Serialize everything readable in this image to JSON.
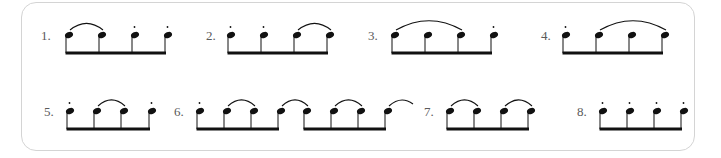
{
  "colors": {
    "ink": "#111111",
    "frame": "#d4d4d4",
    "label": "#5a5a5a"
  },
  "exercises": [
    {
      "label": "1.",
      "label_x": 41,
      "row": 0,
      "groups": [
        {
          "notes": [
            69,
            102,
            135,
            168
          ]
        }
      ],
      "staccato": [
        2,
        3
      ],
      "slurs": [
        [
          0,
          1
        ]
      ],
      "open_slur": false
    },
    {
      "label": "2.",
      "label_x": 206,
      "row": 0,
      "groups": [
        {
          "notes": [
            231,
            264,
            297,
            330
          ]
        }
      ],
      "staccato": [
        0,
        1
      ],
      "slurs": [
        [
          2,
          3
        ]
      ],
      "open_slur": false
    },
    {
      "label": "3.",
      "label_x": 368,
      "row": 0,
      "groups": [
        {
          "notes": [
            395,
            428,
            461,
            494
          ]
        }
      ],
      "staccato": [
        3
      ],
      "slurs": [
        [
          0,
          2
        ]
      ],
      "open_slur": false
    },
    {
      "label": "4.",
      "label_x": 541,
      "row": 0,
      "groups": [
        {
          "notes": [
            566,
            599,
            632,
            665
          ]
        }
      ],
      "staccato": [
        0
      ],
      "slurs": [
        [
          1,
          3
        ]
      ],
      "open_slur": false
    },
    {
      "label": "5.",
      "label_x": 44,
      "row": 1,
      "groups": [
        {
          "notes": [
            70,
            97,
            124,
            152
          ]
        }
      ],
      "staccato": [
        0,
        3
      ],
      "slurs": [
        [
          1,
          2
        ]
      ],
      "open_slur": false
    },
    {
      "label": "6.",
      "label_x": 174,
      "row": 1,
      "groups": [
        {
          "notes": [
            200,
            227,
            254,
            281
          ]
        },
        {
          "notes": [
            307,
            334,
            361,
            388
          ]
        }
      ],
      "staccato": [
        0
      ],
      "slurs": [
        [
          1,
          2
        ],
        [
          3,
          4
        ],
        [
          5,
          6
        ]
      ],
      "open_slur": true
    },
    {
      "label": "7.",
      "label_x": 424,
      "row": 1,
      "groups": [
        {
          "notes": [
            450,
            477,
            504,
            531
          ]
        }
      ],
      "staccato": [],
      "slurs": [
        [
          0,
          1
        ],
        [
          2,
          3
        ]
      ],
      "open_slur": false
    },
    {
      "label": "8.",
      "label_x": 577,
      "row": 1,
      "groups": [
        {
          "notes": [
            603,
            630,
            657,
            684
          ]
        }
      ],
      "staccato": [
        0,
        1,
        2,
        3
      ],
      "slurs": [],
      "open_slur": false
    }
  ],
  "rows": [
    {
      "note_y": 35,
      "beam_y": 53,
      "label_y": 40
    },
    {
      "note_y": 111,
      "beam_y": 129,
      "label_y": 116
    }
  ]
}
